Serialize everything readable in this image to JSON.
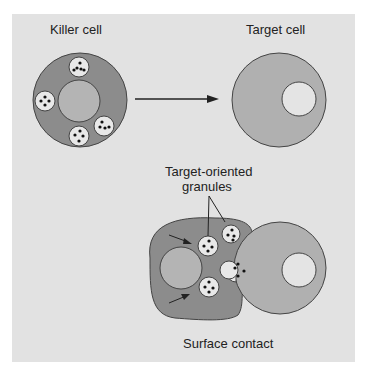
{
  "figure": {
    "labels": {
      "killer_cell": "Killer cell",
      "target_cell": "Target cell",
      "granules_line1": "Target-oriented",
      "granules_line2": "granules",
      "surface_contact": "Surface contact"
    },
    "colors": {
      "background": "#e2e2e2",
      "killer_cytoplasm": "#8c8c8c",
      "target_cytoplasm": "#b0b0b0",
      "nucleus_killer": "#b4b4b4",
      "nucleus_target": "#e4e4e4",
      "granule": "#e8e8e8",
      "outline": "#444444"
    }
  }
}
